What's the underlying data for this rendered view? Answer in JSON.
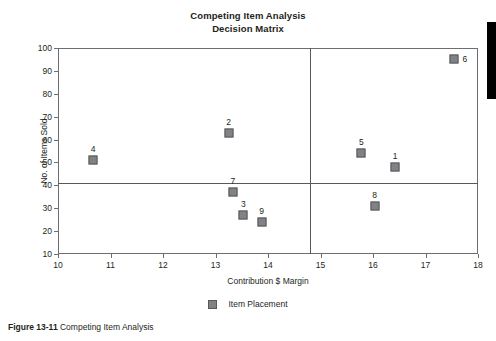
{
  "chart_data": {
    "type": "scatter",
    "title": "Competing Item Analysis",
    "subtitle": "Decision Matrix",
    "xlabel": "Contribution $ Margin",
    "ylabel": "No. of Items Sold",
    "xlim": [
      10,
      18
    ],
    "ylim": [
      10,
      100
    ],
    "xticks": [
      10,
      11,
      12,
      13,
      14,
      15,
      16,
      17,
      18
    ],
    "yticks": [
      10,
      20,
      30,
      40,
      50,
      60,
      70,
      80,
      90,
      100
    ],
    "grid": false,
    "legend": {
      "position": "bottom",
      "entries": [
        "Item Placement"
      ]
    },
    "quadrant_lines": {
      "horizontal_y": 41,
      "vertical_x": 14.8
    },
    "series": [
      {
        "name": "Item Placement",
        "marker": "square",
        "color": "#808285",
        "points": [
          {
            "label": "1",
            "x": 16.42,
            "y": 48,
            "label_pos": "above"
          },
          {
            "label": "2",
            "x": 13.25,
            "y": 63,
            "label_pos": "above"
          },
          {
            "label": "3",
            "x": 13.53,
            "y": 27,
            "label_pos": "above"
          },
          {
            "label": "4",
            "x": 10.67,
            "y": 51,
            "label_pos": "above"
          },
          {
            "label": "5",
            "x": 15.78,
            "y": 54,
            "label_pos": "above"
          },
          {
            "label": "6",
            "x": 17.55,
            "y": 95,
            "label_pos": "right"
          },
          {
            "label": "7",
            "x": 13.33,
            "y": 37,
            "label_pos": "above"
          },
          {
            "label": "8",
            "x": 16.03,
            "y": 31,
            "label_pos": "above"
          },
          {
            "label": "9",
            "x": 13.88,
            "y": 24,
            "label_pos": "above"
          }
        ]
      }
    ]
  },
  "legend": {
    "label": "Item Placement"
  },
  "caption": {
    "figure_number": "Figure 13-11",
    "text": "Competing Item Analysis"
  }
}
